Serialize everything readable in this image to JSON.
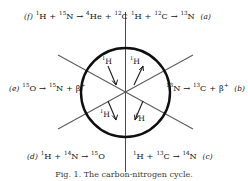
{
  "figure": {
    "caption": "Fig. 1. The carbon-nitrogen cycle.",
    "background_color": "#ffffff",
    "ink_color": "#111111"
  },
  "circle": {
    "center_x": 125.5,
    "center_y": 92.5,
    "radius": 44.5,
    "stroke_width": 2.3
  },
  "reactions": [
    {
      "id": "f",
      "tag": "(f)",
      "position": "top-left",
      "tag_side": "left",
      "equation": "¹H + ¹⁵N → ⁴He + ¹²C",
      "parts": [
        {
          "sup": "1",
          "text": "H"
        },
        {
          "text": " + "
        },
        {
          "sup": "15",
          "text": "N"
        },
        {
          "text": " → "
        },
        {
          "sup": "4",
          "text": "He"
        },
        {
          "text": " + "
        },
        {
          "sup": "12",
          "text": "C"
        }
      ]
    },
    {
      "id": "a",
      "tag": "(a)",
      "position": "top-right",
      "tag_side": "right",
      "equation": "¹H + ¹²C → ¹³N",
      "parts": [
        {
          "sup": "1",
          "text": "H"
        },
        {
          "text": " + "
        },
        {
          "sup": "12",
          "text": "C"
        },
        {
          "text": " → "
        },
        {
          "sup": "13",
          "text": "N"
        }
      ]
    },
    {
      "id": "e",
      "tag": "(e)",
      "position": "middle-left",
      "tag_side": "left",
      "equation": "¹⁵O → ¹⁵N + β⁺",
      "parts": [
        {
          "sup": "15",
          "text": "O"
        },
        {
          "text": " → "
        },
        {
          "sup": "15",
          "text": "N"
        },
        {
          "text": " + "
        },
        {
          "text": "β",
          "sup_after": "+"
        }
      ]
    },
    {
      "id": "b",
      "tag": "(b)",
      "position": "middle-right",
      "tag_side": "right",
      "equation": "¹³N → ¹³C + β⁺",
      "parts": [
        {
          "sup": "13",
          "text": "N"
        },
        {
          "text": " → "
        },
        {
          "sup": "13",
          "text": "C"
        },
        {
          "text": " + "
        },
        {
          "text": "β",
          "sup_after": "+"
        }
      ]
    },
    {
      "id": "d",
      "tag": "(d)",
      "position": "bottom-left",
      "tag_side": "left",
      "equation": "¹H + ¹⁴N → ¹⁵O",
      "parts": [
        {
          "sup": "1",
          "text": "H"
        },
        {
          "text": " + "
        },
        {
          "sup": "14",
          "text": "N"
        },
        {
          "text": " → "
        },
        {
          "sup": "15",
          "text": "O"
        }
      ]
    },
    {
      "id": "c",
      "tag": "(c)",
      "position": "bottom-right",
      "tag_side": "right",
      "equation": "¹H + ¹³C → ¹⁴N",
      "parts": [
        {
          "sup": "1",
          "text": "H"
        },
        {
          "text": " + "
        },
        {
          "sup": "13",
          "text": "C"
        },
        {
          "text": " → "
        },
        {
          "sup": "14",
          "text": "N"
        }
      ]
    }
  ],
  "inner_labels": [
    {
      "id": "h-tl",
      "mass": "1",
      "symbol": "H",
      "text": "¹H",
      "sector": "top-left-inner"
    },
    {
      "id": "h-tr",
      "mass": "1",
      "symbol": "H",
      "text": "¹H",
      "sector": "top-right-inner"
    },
    {
      "id": "h-bl",
      "mass": "1",
      "symbol": "H",
      "text": "¹H",
      "sector": "bottom-left-inner"
    },
    {
      "id": "h-br",
      "mass": "1",
      "symbol": "H",
      "text": "¹H",
      "sector": "bottom-right-inner"
    }
  ],
  "texts": {
    "eq_f_tag": "(f)",
    "eq_a_tag": "(a)",
    "eq_e_tag": "(e)",
    "eq_b_tag": "(b)",
    "eq_d_tag": "(d)",
    "eq_c_tag": "(c)"
  }
}
